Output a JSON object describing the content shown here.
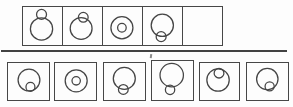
{
  "colors": {
    "line": "#454545",
    "border": "#474747",
    "background": "#fdfdfd"
  },
  "problem_strip": {
    "cells": [
      {
        "id": "problem-cell-1",
        "relation": "small-circle-outside-top",
        "shapes": {
          "large": {
            "cx": 19.0,
            "cy": 21.5,
            "r": 11.4
          },
          "small": {
            "cx": 19.0,
            "cy": 6.6,
            "r": 5.1
          }
        }
      },
      {
        "id": "problem-cell-2",
        "relation": "small-circle-on-top-edge",
        "shapes": {
          "large": {
            "cx": 18.6,
            "cy": 21.0,
            "r": 11.2
          },
          "small": {
            "cx": 20.8,
            "cy": 9.6,
            "r": 5.0
          }
        }
      },
      {
        "id": "problem-cell-3",
        "relation": "small-circle-centered-inside",
        "shapes": {
          "large": {
            "cx": 19.4,
            "cy": 20.3,
            "r": 11.3
          },
          "small": {
            "cx": 19.4,
            "cy": 20.3,
            "r": 4.4
          }
        }
      },
      {
        "id": "problem-cell-4",
        "relation": "small-circle-on-bottom-edge",
        "shapes": {
          "large": {
            "cx": 19.8,
            "cy": 17.8,
            "r": 11.4
          },
          "small": {
            "cx": 18.6,
            "cy": 29.4,
            "r": 5.1
          }
        }
      },
      {
        "id": "problem-cell-5",
        "relation": "empty-answer-cell",
        "shapes": null
      }
    ]
  },
  "answer_options": [
    {
      "id": "option-1",
      "relation": "small-circle-inside-bottom",
      "shapes": {
        "large": {
          "cx": 21.5,
          "cy": 17.5,
          "r": 11.2
        },
        "small": {
          "cx": 23.0,
          "cy": 24.6,
          "r": 4.6
        }
      }
    },
    {
      "id": "option-2",
      "relation": "small-circle-centered-inside",
      "shapes": {
        "large": {
          "cx": 21.7,
          "cy": 18.3,
          "r": 11.3
        },
        "small": {
          "cx": 21.7,
          "cy": 18.3,
          "r": 4.3
        }
      }
    },
    {
      "id": "option-3",
      "relation": "small-circle-on-bottom-edge",
      "shapes": {
        "large": {
          "cx": 20.8,
          "cy": 15.8,
          "r": 11.3
        },
        "small": {
          "cx": 19.8,
          "cy": 27.2,
          "r": 5.0
        }
      }
    },
    {
      "id": "option-4",
      "relation": "small-circle-outside-bottom",
      "shapes": {
        "large": {
          "cx": 20.2,
          "cy": 14.5,
          "r": 12.0
        },
        "small": {
          "cx": 18.5,
          "cy": 29.6,
          "r": 4.8
        }
      }
    },
    {
      "id": "option-5",
      "relation": "small-circle-inside-top",
      "shapes": {
        "large": {
          "cx": 18.5,
          "cy": 17.5,
          "r": 11.5
        },
        "small": {
          "cx": 19.5,
          "cy": 10.4,
          "r": 5.0
        }
      }
    },
    {
      "id": "option-6",
      "relation": "small-circle-inside-bottom",
      "shapes": {
        "large": {
          "cx": 20.8,
          "cy": 16.5,
          "r": 11.0
        },
        "small": {
          "cx": 23.2,
          "cy": 24.0,
          "r": 4.7
        }
      }
    }
  ]
}
